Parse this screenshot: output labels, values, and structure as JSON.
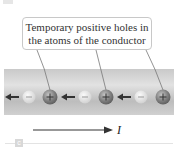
{
  "callout": {
    "line1": "Temporary positive holes in",
    "line2": "the atoms of the conductor"
  },
  "conductor": {
    "charges": [
      {
        "type": "negative",
        "symbol": "−",
        "x": 29
      },
      {
        "type": "positive",
        "symbol": "+",
        "x": 50
      },
      {
        "type": "negative",
        "symbol": "−",
        "x": 85
      },
      {
        "type": "positive",
        "symbol": "+",
        "x": 106
      },
      {
        "type": "negative",
        "symbol": "−",
        "x": 141
      },
      {
        "type": "positive",
        "symbol": "+",
        "x": 163
      }
    ],
    "electron_flow_direction": "left"
  },
  "current": {
    "label": "I",
    "direction": "right"
  },
  "part_label": "c",
  "colors": {
    "conductor": "#b8b8b8",
    "arrow": "#333333",
    "positive": "#7a7a7a",
    "negative": "#dcdcdc"
  }
}
